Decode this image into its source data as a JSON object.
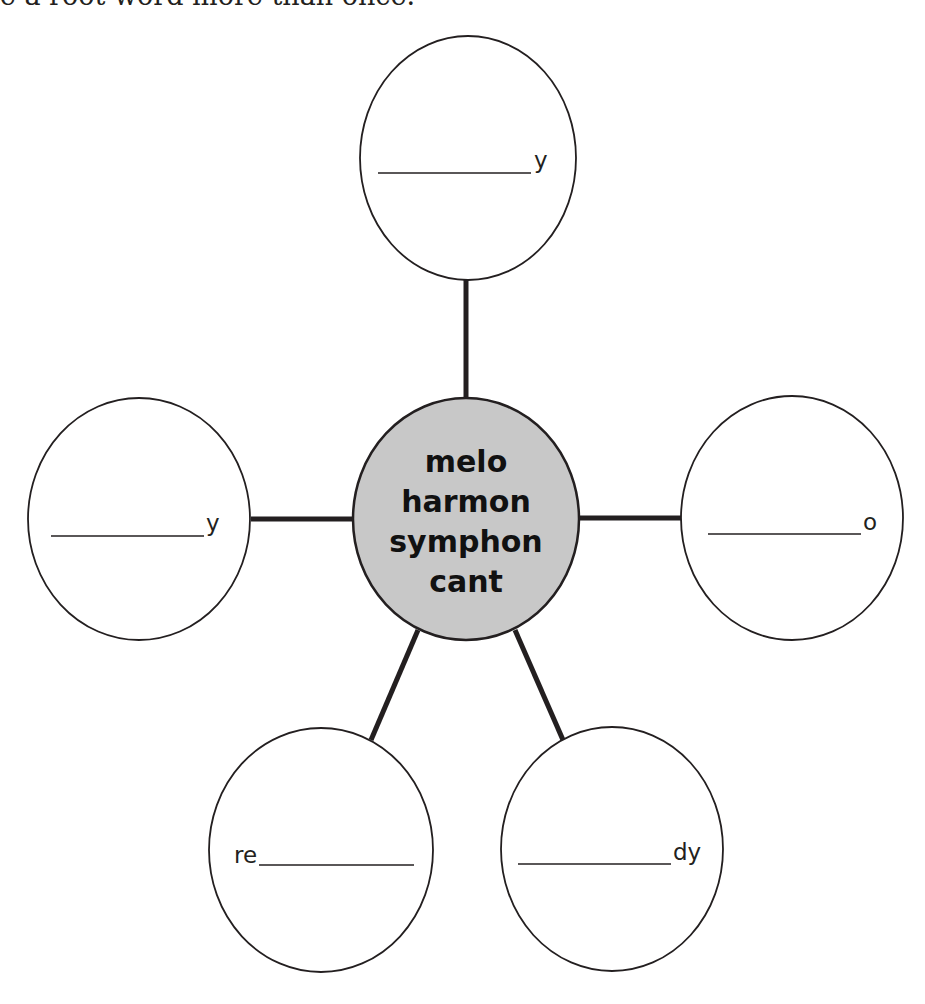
{
  "instruction": "se a root word more than once.",
  "center": {
    "lines": [
      "melo",
      "harmon",
      "symphon",
      "cant"
    ],
    "fill": "#c8c8c8"
  },
  "leaves": [
    {
      "position": "top",
      "prefix": "",
      "suffix": "y"
    },
    {
      "position": "left",
      "prefix": "",
      "suffix": "y"
    },
    {
      "position": "right",
      "prefix": "",
      "suffix": "o"
    },
    {
      "position": "bottom-left",
      "prefix": "re",
      "suffix": ""
    },
    {
      "position": "bottom-right",
      "prefix": "",
      "suffix": "dy"
    }
  ]
}
